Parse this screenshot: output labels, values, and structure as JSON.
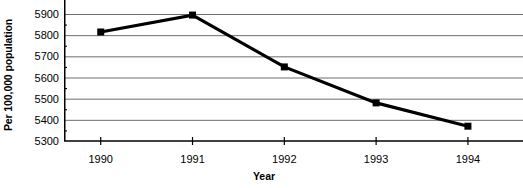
{
  "chart_data": {
    "type": "line",
    "title": "",
    "xlabel": "Year",
    "ylabel": "Per 100,000 population",
    "categories": [
      "1990",
      "1991",
      "1992",
      "1993",
      "1994"
    ],
    "x": [
      1990,
      1991,
      1992,
      1993,
      1994
    ],
    "values": [
      5815,
      5895,
      5650,
      5480,
      5370
    ],
    "series": [
      {
        "name": "",
        "values": [
          5815,
          5895,
          5650,
          5480,
          5370
        ]
      }
    ],
    "ylim": [
      5300,
      5900
    ],
    "xlim": [
      1989.6,
      1994.6
    ],
    "ytick_labels": [
      "5300",
      "5400",
      "5500",
      "5600",
      "5700",
      "5800",
      "5900"
    ],
    "ytick_values": [
      5300,
      5400,
      5500,
      5600,
      5700,
      5800,
      5900
    ],
    "yminor_values": [
      5350,
      5450,
      5550,
      5650,
      5750,
      5850
    ],
    "ytick_step": 100,
    "yminor_step": 50,
    "xtick_labels": [
      "1990",
      "1991",
      "1992",
      "1993",
      "1994"
    ],
    "grid": "horizontal",
    "legend": "none",
    "marker": "square",
    "line_color": "#000000",
    "marker_color": "#000000",
    "grid_color": "#6e6e6e",
    "axis_color": "#000000",
    "background_color": "#ffffff"
  }
}
